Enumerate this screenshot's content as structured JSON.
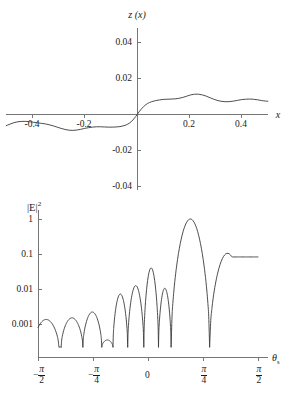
{
  "figure": {
    "background": "#ffffff",
    "curve_color": "#3a3a3a",
    "axis_color": "#767676",
    "text_color": "#1a1a1a"
  },
  "top_panel": {
    "ylabel": "z (x)",
    "xlabel": "x",
    "y_ticks": [
      "0.04",
      "0.02",
      "-0.02",
      "-0.04"
    ],
    "x_ticks": [
      "-0.4",
      "-0.2",
      "0.2",
      "0.4"
    ]
  },
  "bottom_panel": {
    "ylabel_base": "|E|",
    "ylabel_exp": "2",
    "xlabel_base": "θ",
    "xlabel_sub": "s",
    "y_ticks": [
      "1",
      "0.1",
      "0.01",
      "0.001"
    ],
    "x_ticks": [
      "-π/2",
      "-π/4",
      "0",
      "π/4",
      "π/2"
    ],
    "x_tick_zero": "0",
    "pi_symbol": "π",
    "den_two": "2",
    "den_four": "4",
    "minus": "−"
  },
  "chart_data": [
    {
      "type": "line",
      "title": "",
      "ylabel": "z (x)",
      "xlabel": "x",
      "xlim": [
        -0.5,
        0.5
      ],
      "ylim": [
        -0.05,
        0.05
      ],
      "grid": false,
      "legend": "none",
      "xticks": [
        -0.4,
        -0.2,
        0.2,
        0.4
      ],
      "yticks": [
        -0.04,
        -0.02,
        0.02,
        0.04
      ],
      "x": [
        -0.5,
        -0.485,
        -0.47,
        -0.455,
        -0.44,
        -0.425,
        -0.41,
        -0.395,
        -0.38,
        -0.365,
        -0.35,
        -0.335,
        -0.32,
        -0.305,
        -0.29,
        -0.275,
        -0.26,
        -0.245,
        -0.23,
        -0.215,
        -0.2,
        -0.185,
        -0.17,
        -0.155,
        -0.14,
        -0.125,
        -0.11,
        -0.095,
        -0.08,
        -0.065,
        -0.05,
        -0.035,
        -0.02,
        -0.005,
        0.01,
        0.025,
        0.04,
        0.055,
        0.07,
        0.085,
        0.1,
        0.115,
        0.13,
        0.145,
        0.16,
        0.175,
        0.19,
        0.205,
        0.22,
        0.235,
        0.25,
        0.265,
        0.28,
        0.295,
        0.31,
        0.325,
        0.34,
        0.355,
        0.37,
        0.385,
        0.4,
        0.415,
        0.43,
        0.445,
        0.46,
        0.475,
        0.49,
        0.5
      ],
      "y": [
        -0.0065,
        -0.0056,
        -0.0048,
        -0.0043,
        -0.0041,
        -0.0041,
        -0.0043,
        -0.0046,
        -0.0049,
        -0.0052,
        -0.0055,
        -0.006,
        -0.0066,
        -0.0073,
        -0.008,
        -0.0086,
        -0.009,
        -0.0091,
        -0.0089,
        -0.0085,
        -0.008,
        -0.0076,
        -0.0073,
        -0.0071,
        -0.0071,
        -0.0072,
        -0.0073,
        -0.0073,
        -0.0072,
        -0.007,
        -0.0065,
        -0.0056,
        -0.004,
        -0.0014,
        0.0016,
        0.0041,
        0.0058,
        0.0068,
        0.0074,
        0.0078,
        0.0081,
        0.0082,
        0.0083,
        0.0084,
        0.0087,
        0.0092,
        0.0099,
        0.0106,
        0.011,
        0.011,
        0.0106,
        0.0099,
        0.009,
        0.0081,
        0.0074,
        0.007,
        0.0068,
        0.0069,
        0.0072,
        0.0076,
        0.008,
        0.0082,
        0.0083,
        0.0082,
        0.0079,
        0.0075,
        0.0072,
        0.0071
      ]
    },
    {
      "type": "line",
      "title": "",
      "ylabel": "|E|^2",
      "xlabel": "theta_s",
      "yscale": "log",
      "xlim": [
        -1.5708,
        1.5708
      ],
      "ylim": [
        0.0002,
        1.3
      ],
      "grid": false,
      "legend": "none",
      "xticks": [
        -1.5708,
        -0.7854,
        0,
        0.7854,
        1.5708
      ],
      "xticklabels": [
        "-π/2",
        "-π/4",
        "0",
        "π/4",
        "π/2"
      ],
      "yticks": [
        0.001,
        0.01,
        0.1,
        1
      ],
      "yticklabels": [
        "0.001",
        "0.01",
        "0.1",
        "1"
      ],
      "lobe_peaks": [
        {
          "x": -1.5708,
          "y": 0.00135
        },
        {
          "x": -1.4,
          "y": 0.00135
        },
        {
          "x": -1.05,
          "y": 0.0015
        },
        {
          "x": -0.8,
          "y": 0.0022
        },
        {
          "x": -0.57,
          "y": 0.00035
        },
        {
          "x": -0.4,
          "y": 0.0072
        },
        {
          "x": -0.17,
          "y": 0.0125
        },
        {
          "x": 0.06,
          "y": 0.04
        },
        {
          "x": 0.24,
          "y": 0.0105
        },
        {
          "x": 0.5,
          "y": 1.0
        },
        {
          "x": 1.25,
          "y": 0.105
        },
        {
          "x": 1.5708,
          "y": 0.08
        }
      ],
      "nulls": [
        -1.24,
        -0.93,
        -0.66,
        -0.5,
        -0.29,
        -0.06,
        0.15,
        0.33,
        0.88
      ]
    }
  ]
}
